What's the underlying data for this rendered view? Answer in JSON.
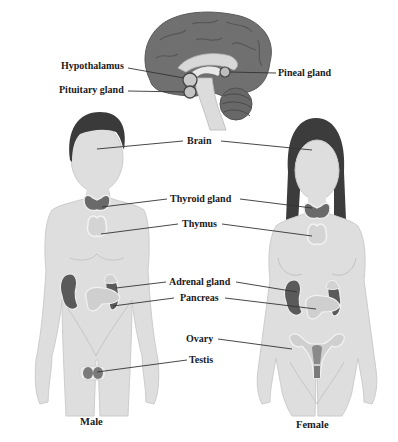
{
  "diagram": {
    "type": "endocrine-system-anatomy",
    "figures": [
      {
        "id": "male",
        "caption": "Male"
      },
      {
        "id": "female",
        "caption": "Female"
      }
    ],
    "brain_inset": {
      "labels": {
        "hypothalamus": "Hypothalamus",
        "pituitary": "Pituitary gland",
        "pineal": "Pineal gland"
      }
    },
    "body_labels": {
      "brain": "Brain",
      "thyroid": "Thyroid gland",
      "thymus": "Thymus",
      "adrenal": "Adrenal gland",
      "pancreas": "Pancreas",
      "ovary": "Ovary",
      "testis": "Testis"
    },
    "colors": {
      "skin": "#dedede",
      "skin_outline": "#c8c8c8",
      "hair": "#3a3a3a",
      "brain": "#6e6e6e",
      "brain_dark": "#555555",
      "gland_dark": "#6a6a6a",
      "gland_light": "#d4d4d4",
      "leader_line": "#333333",
      "text": "#1a1a1a"
    }
  }
}
